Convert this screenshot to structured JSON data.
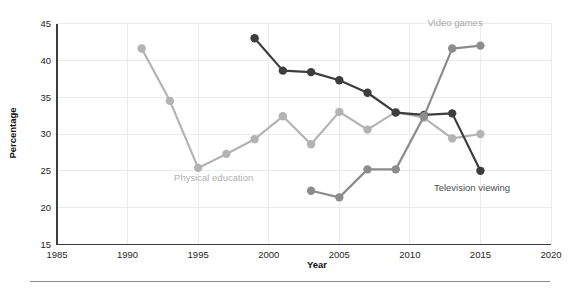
{
  "chart_data": {
    "type": "line",
    "title": "",
    "xlabel": "Year",
    "ylabel": "Percentage",
    "xlim": [
      1985,
      2020
    ],
    "ylim": [
      15,
      45
    ],
    "xticks": [
      1985,
      1990,
      1995,
      2000,
      2005,
      2010,
      2015,
      2020
    ],
    "yticks": [
      15,
      20,
      25,
      30,
      35,
      40,
      45
    ],
    "xtick_labels": [
      "1985",
      "1990",
      "1995",
      "2000",
      "2005",
      "2010",
      "2015",
      "2020"
    ],
    "ytick_labels": [
      "15",
      "20",
      "25",
      "30",
      "35",
      "40",
      "45"
    ],
    "grid": true,
    "legend_position": "inline-labels",
    "series": [
      {
        "name": "Physical education",
        "color": "#b3b3b3",
        "label_color": "#b0b0b0",
        "x": [
          1991,
          1993,
          1995,
          1997,
          1999,
          2001,
          2003,
          2005,
          2007,
          2009,
          2011,
          2013,
          2015
        ],
        "values": [
          41.6,
          34.5,
          25.4,
          27.3,
          29.3,
          32.4,
          28.6,
          33.0,
          30.6,
          33.0,
          32.2,
          29.4,
          30.0
        ]
      },
      {
        "name": "Television viewing",
        "color": "#3d3d3d",
        "label_color": "#4d4d4d",
        "x": [
          1999,
          2001,
          2003,
          2005,
          2007,
          2009,
          2011,
          2013,
          2015
        ],
        "values": [
          43.0,
          38.6,
          38.4,
          37.3,
          35.6,
          32.9,
          32.6,
          32.8,
          25.0
        ]
      },
      {
        "name": "Video games",
        "color": "#8c8c8c",
        "label_color": "#a6a6a6",
        "x": [
          2003,
          2005,
          2007,
          2009,
          2011,
          2013,
          2015
        ],
        "values": [
          22.3,
          21.4,
          25.2,
          25.2,
          32.4,
          41.6,
          42.0
        ]
      }
    ],
    "annotations": [
      {
        "text": "Video games",
        "x": 2013.2,
        "y": 44.6,
        "anchor": "middle",
        "color": "#a6a6a6"
      },
      {
        "text": "Physical education",
        "x": 1996.1,
        "y": 23.6,
        "anchor": "middle",
        "color": "#b0b0b0"
      },
      {
        "text": "Television viewing",
        "x": 2014.4,
        "y": 22.2,
        "anchor": "middle",
        "color": "#4d4d4d"
      }
    ]
  }
}
